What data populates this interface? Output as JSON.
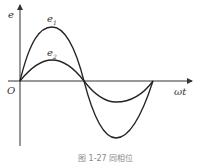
{
  "figure": {
    "caption": "图 1-27 同相位",
    "y_axis_label": "e",
    "x_axis_label": "ωt",
    "origin_label": "O",
    "curves": [
      {
        "name": "e1",
        "label_base": "e",
        "label_sub": "1",
        "amplitude": "large",
        "color": "#222222"
      },
      {
        "name": "e2",
        "label_base": "e",
        "label_sub": "2",
        "amplitude": "small",
        "color": "#222222"
      }
    ],
    "relationship": "in phase"
  }
}
